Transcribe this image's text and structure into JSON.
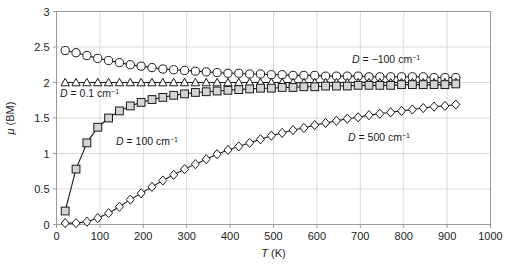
{
  "figure": {
    "background": "#ffffff",
    "plot_frame_color": "#9a9a9a",
    "grid_color": "#d9d9d9",
    "series_color": "#1a1a1a",
    "square_fill": "#d4d4d4"
  },
  "axes": {
    "x_title": "T (K)",
    "y_title": "μ (BM)",
    "x_ticks": [
      "0",
      "100",
      "200",
      "300",
      "400",
      "500",
      "600",
      "700",
      "800",
      "900",
      "1000"
    ],
    "y_ticks": [
      "0",
      "0.5",
      "1",
      "1.5",
      "2",
      "2.5",
      "3"
    ]
  },
  "annotations": [
    {
      "name": "annotation-d-minus-100",
      "symbol": "D",
      "eq": " = −100 cm",
      "sup": "−1",
      "x": 352,
      "y": 63
    },
    {
      "name": "annotation-d-0p1",
      "symbol": "D",
      "eq": " = 0.1 cm",
      "sup": "−1",
      "x": 60,
      "y": 97
    },
    {
      "name": "annotation-d-100",
      "symbol": "D",
      "eq": " = 100 cm",
      "sup": "−1",
      "x": 116,
      "y": 145
    },
    {
      "name": "annotation-d-500",
      "symbol": "D",
      "eq": " = 500 cm",
      "sup": "−1",
      "x": 348,
      "y": 141
    }
  ],
  "chart_data": {
    "type": "line",
    "title": "",
    "xlabel": "T (K)",
    "ylabel": "μ (BM)",
    "xlim": [
      0,
      1000
    ],
    "ylim": [
      0,
      3
    ],
    "xticks": [
      0,
      100,
      200,
      300,
      400,
      500,
      600,
      700,
      800,
      900,
      1000
    ],
    "yticks": [
      0,
      0.5,
      1,
      1.5,
      2,
      2.5,
      3
    ],
    "grid": true,
    "legend": "inline-annotations",
    "series": [
      {
        "name": "D = -100 cm^-1",
        "marker": "circle",
        "marker_fill": "#ffffff",
        "x": [
          20,
          45,
          70,
          95,
          120,
          145,
          170,
          195,
          220,
          245,
          270,
          295,
          320,
          345,
          370,
          395,
          420,
          445,
          470,
          495,
          520,
          545,
          570,
          595,
          620,
          645,
          670,
          695,
          720,
          745,
          770,
          795,
          820,
          845,
          870,
          895,
          920
        ],
        "y": [
          2.45,
          2.42,
          2.38,
          2.34,
          2.31,
          2.28,
          2.25,
          2.23,
          2.21,
          2.19,
          2.18,
          2.17,
          2.16,
          2.15,
          2.14,
          2.13,
          2.13,
          2.12,
          2.12,
          2.11,
          2.11,
          2.1,
          2.1,
          2.1,
          2.09,
          2.09,
          2.09,
          2.09,
          2.08,
          2.08,
          2.08,
          2.08,
          2.08,
          2.08,
          2.07,
          2.07,
          2.07
        ]
      },
      {
        "name": "D = 0.1 cm^-1",
        "marker": "triangle",
        "marker_fill": "#ffffff",
        "x": [
          20,
          45,
          70,
          95,
          120,
          145,
          170,
          195,
          220,
          245,
          270,
          295,
          320,
          345,
          370,
          395,
          420,
          445,
          470,
          495,
          520,
          545,
          570,
          595,
          620,
          645,
          670,
          695,
          720,
          745,
          770,
          795,
          820,
          845,
          870,
          895,
          920
        ],
        "y": [
          2.0,
          2.0,
          2.0,
          2.0,
          2.0,
          2.0,
          2.0,
          2.0,
          2.0,
          2.0,
          2.0,
          2.0,
          2.0,
          2.0,
          2.0,
          2.0,
          2.0,
          2.0,
          2.0,
          2.0,
          2.0,
          2.0,
          2.0,
          2.0,
          2.0,
          2.0,
          2.0,
          2.0,
          2.0,
          2.0,
          2.0,
          2.0,
          2.0,
          2.0,
          2.0,
          2.0,
          2.0
        ]
      },
      {
        "name": "D = 100 cm^-1",
        "marker": "square",
        "marker_fill": "#d4d4d4",
        "x": [
          20,
          45,
          70,
          95,
          120,
          145,
          170,
          195,
          220,
          245,
          270,
          295,
          320,
          345,
          370,
          395,
          420,
          445,
          470,
          495,
          520,
          545,
          570,
          595,
          620,
          645,
          670,
          695,
          720,
          745,
          770,
          795,
          820,
          845,
          870,
          895,
          920
        ],
        "y": [
          0.19,
          0.78,
          1.15,
          1.37,
          1.5,
          1.6,
          1.67,
          1.72,
          1.76,
          1.79,
          1.82,
          1.84,
          1.86,
          1.87,
          1.88,
          1.89,
          1.9,
          1.91,
          1.92,
          1.92,
          1.93,
          1.93,
          1.94,
          1.94,
          1.95,
          1.95,
          1.95,
          1.96,
          1.96,
          1.96,
          1.96,
          1.97,
          1.97,
          1.97,
          1.97,
          1.97,
          1.98
        ]
      },
      {
        "name": "D = 500 cm^-1",
        "marker": "diamond",
        "marker_fill": "#ffffff",
        "x": [
          20,
          45,
          70,
          95,
          120,
          145,
          170,
          195,
          220,
          245,
          270,
          295,
          320,
          345,
          370,
          395,
          420,
          445,
          470,
          495,
          520,
          545,
          570,
          595,
          620,
          645,
          670,
          695,
          720,
          745,
          770,
          795,
          820,
          845,
          870,
          895,
          920
        ],
        "y": [
          0.02,
          0.02,
          0.04,
          0.09,
          0.16,
          0.25,
          0.35,
          0.44,
          0.53,
          0.62,
          0.7,
          0.78,
          0.85,
          0.92,
          0.99,
          1.05,
          1.1,
          1.15,
          1.2,
          1.25,
          1.29,
          1.33,
          1.36,
          1.4,
          1.43,
          1.46,
          1.49,
          1.51,
          1.54,
          1.56,
          1.58,
          1.6,
          1.62,
          1.64,
          1.66,
          1.67,
          1.69
        ]
      }
    ]
  }
}
